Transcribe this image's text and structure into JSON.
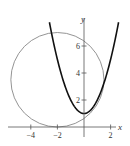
{
  "chart_data": {
    "type": "line",
    "title": "",
    "xlabel": "x",
    "ylabel": "y",
    "xlim": [
      -5.8,
      2.6
    ],
    "ylim": [
      -0.8,
      7.8
    ],
    "grid": false,
    "x_ticks": [
      -4,
      -2,
      2
    ],
    "y_ticks": [
      2,
      4,
      6
    ],
    "series": [
      {
        "name": "parabola",
        "equation": "y = x^2 + 1",
        "color": "#111111",
        "stroke_width": 1.6,
        "x_range": [
          -2.6,
          2.6
        ]
      },
      {
        "name": "circle",
        "equation": "(x + 2)^2 + (y - 3.5)^2 = 3.5^2",
        "center": [
          -2,
          3.5
        ],
        "radius": 3.5,
        "color": "#888888",
        "stroke_width": 0.9
      }
    ]
  },
  "axes": {
    "x_label": "x",
    "y_label": "y",
    "x_tick_labels": [
      "−4",
      "−2",
      "2"
    ],
    "y_tick_labels": [
      "2",
      "4",
      "6"
    ]
  }
}
